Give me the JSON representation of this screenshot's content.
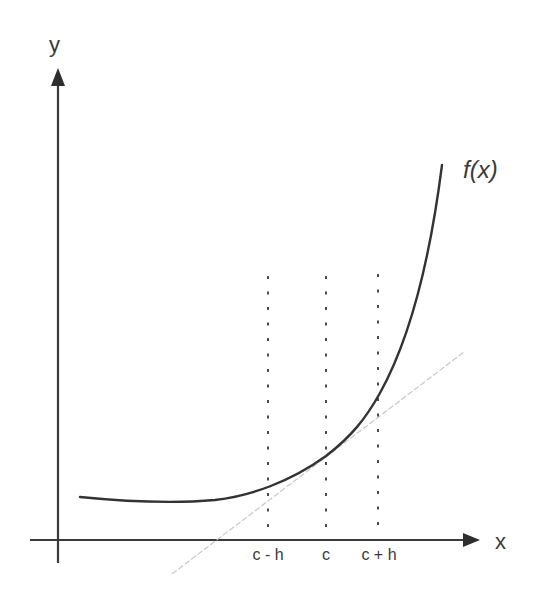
{
  "diagram": {
    "type": "derivative-central-difference",
    "axes": {
      "x_label": "x",
      "y_label": "y"
    },
    "function_label": "f(x)",
    "ticks": [
      {
        "id": "c_minus_h",
        "label": "c - h"
      },
      {
        "id": "c",
        "label": "c"
      },
      {
        "id": "c_plus_h",
        "label": "c + h"
      }
    ],
    "colors": {
      "axis": "#3a3a3a",
      "curve": "#3a3a3a",
      "dashed": "#4a4a4a",
      "tangent": "#c8c8c8",
      "text": "#3a3a3a"
    }
  }
}
